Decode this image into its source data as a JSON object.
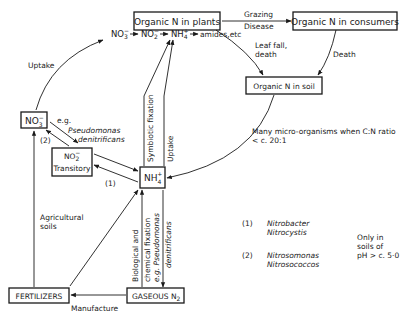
{
  "nodes": {
    "plants": "Organic N in plants",
    "consumers": "Organic N in consumers",
    "soil": "Organic N in soil",
    "nitrate": {
      "base": "NO",
      "sub": "3",
      "sup": "−"
    },
    "nitrite": {
      "base": "NO",
      "sub": "2",
      "sup": "−",
      "note": "Transitory"
    },
    "ammonium": {
      "base": "NH",
      "sub": "4",
      "sup": "+"
    },
    "fertilizers": "FERTILIZERS",
    "gaseous_n2": {
      "base": "GASEOUS N",
      "sub": "2"
    }
  },
  "plant_chain": {
    "nitrate": {
      "base": "NO",
      "sub": "3",
      "sup": "−"
    },
    "nitrite": {
      "base": "NO",
      "sub": "2",
      "sup": "−"
    },
    "ammonium": {
      "base": "NH",
      "sub": "4",
      "sup": "+"
    },
    "end": "amides,etc"
  },
  "edges": {
    "grazing": "Grazing",
    "disease": "Disease",
    "leaf_fall_1": "Leaf fall,",
    "leaf_fall_2": "death",
    "death": "Death",
    "uptake_left": "Uptake",
    "symbiotic": "Symbiotic fixation",
    "uptake_right": "Uptake",
    "micro_1": "Many micro-organisms when C:N ratio",
    "micro_2": "< c. 20:1",
    "eg": "e.g.",
    "pseudomonas": "Pseudomonas",
    "denitrificans": "denitrificans",
    "label_2": "(2)",
    "label_1": "(1)",
    "agricultural_1": "Agricultural",
    "agricultural_2": "soils",
    "manufacture": "Manufacture",
    "bio_1": "Biological and",
    "bio_2": "chemical fixation",
    "eg_pseudo": "e.g. Pseudomonas",
    "denit": "denitrificans"
  },
  "legend": {
    "items": [
      {
        "num": "(1)",
        "org1": "Nitrobacter",
        "org2": "Nitrocystis"
      },
      {
        "num": "(2)",
        "org1": "Nitrosomonas",
        "org2": "Nitrosococcos"
      }
    ],
    "note_1": "Only in",
    "note_2": "soils of",
    "note_3": "pH > c. 5·0"
  }
}
